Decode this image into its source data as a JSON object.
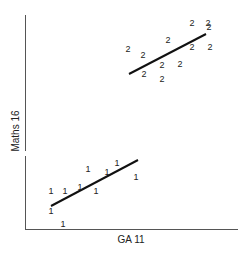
{
  "chart_data": {
    "type": "scatter",
    "title": "",
    "xlabel": "GA 11",
    "ylabel": "Maths 16",
    "grid": false,
    "legend": null,
    "axis_ticks": false,
    "series": [
      {
        "name": "1",
        "marker": "1",
        "points_px": [
          [
            51,
            191
          ],
          [
            65,
            191
          ],
          [
            80,
            187
          ],
          [
            88,
            169
          ],
          [
            96,
            191
          ],
          [
            107,
            172
          ],
          [
            117,
            163
          ],
          [
            136,
            177
          ],
          [
            51,
            211
          ],
          [
            63,
            224
          ]
        ],
        "fit_line_px": [
          [
            51,
            206
          ],
          [
            138,
            160
          ]
        ]
      },
      {
        "name": "2",
        "marker": "2",
        "points_px": [
          [
            128,
            49
          ],
          [
            143,
            55
          ],
          [
            144,
            74
          ],
          [
            162,
            79
          ],
          [
            162,
            65
          ],
          [
            168,
            40
          ],
          [
            180,
            64
          ],
          [
            192,
            23
          ],
          [
            192,
            47
          ],
          [
            208,
            23
          ],
          [
            210,
            47
          ],
          [
            209,
            27
          ]
        ],
        "fit_line_px": [
          [
            129,
            74
          ],
          [
            206,
            34
          ]
        ]
      }
    ]
  },
  "axes": {
    "x_label": "GA 11",
    "y_label": "Maths 16"
  }
}
